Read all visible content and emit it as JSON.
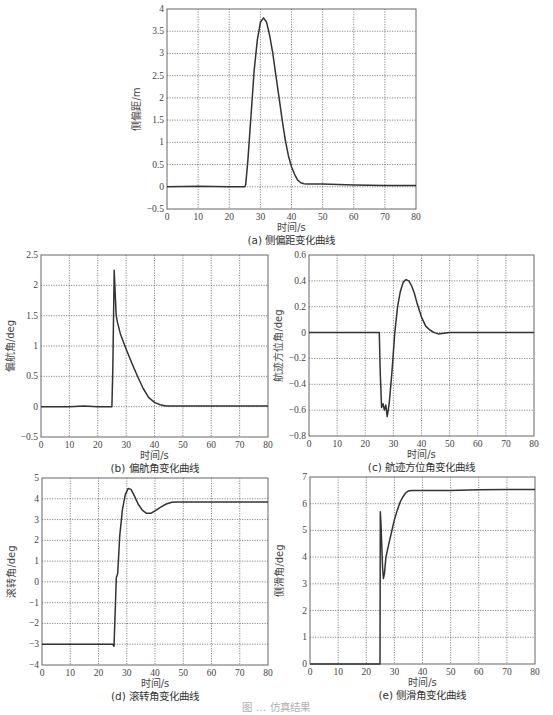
{
  "figure_caption": "图  …  仿真结果",
  "chart_data": [
    {
      "id": "a",
      "type": "line",
      "title": "(a) 侧偏距变化曲线",
      "xlabel": "时间/s",
      "ylabel": "侧偏距/m",
      "xlim": [
        0,
        80
      ],
      "ylim": [
        -0.5,
        4
      ],
      "xticks": [
        0,
        10,
        20,
        30,
        40,
        50,
        60,
        70,
        80
      ],
      "yticks": [
        -0.5,
        0,
        0.5,
        1,
        1.5,
        2,
        2.5,
        3,
        3.5,
        4
      ],
      "grid": true,
      "box": [
        167,
        9,
        416,
        209
      ],
      "x": [
        0,
        10,
        20,
        25,
        25.3,
        26,
        27,
        28,
        29,
        30,
        31,
        32,
        33,
        34,
        35,
        36,
        37,
        38,
        39,
        40,
        41,
        42,
        43,
        44,
        45,
        50,
        60,
        70,
        80
      ],
      "y": [
        0,
        0.01,
        0,
        0,
        0.05,
        0.6,
        1.6,
        2.6,
        3.3,
        3.7,
        3.8,
        3.7,
        3.4,
        3.0,
        2.5,
        2.0,
        1.5,
        1.05,
        0.7,
        0.45,
        0.28,
        0.15,
        0.09,
        0.07,
        0.06,
        0.06,
        0.04,
        0.03,
        0.03
      ]
    },
    {
      "id": "b",
      "type": "line",
      "title": "(b) 偏航角变化曲线",
      "xlabel": "时间/s",
      "ylabel": "偏航角/deg",
      "xlim": [
        0,
        80
      ],
      "ylim": [
        -0.5,
        2.5
      ],
      "xticks": [
        0,
        10,
        20,
        30,
        40,
        50,
        60,
        70,
        80
      ],
      "yticks": [
        -0.5,
        0,
        0.5,
        1,
        1.5,
        2,
        2.5
      ],
      "grid": true,
      "box": [
        41,
        255,
        268,
        437
      ],
      "x": [
        0,
        10,
        15,
        20,
        25,
        25.3,
        25.8,
        26.1,
        26.5,
        27,
        28,
        30,
        32,
        34,
        36,
        38,
        40,
        42,
        44,
        46,
        50,
        60,
        70,
        80
      ],
      "y": [
        0,
        0,
        0.01,
        0,
        0,
        0.6,
        2.25,
        1.9,
        1.5,
        1.38,
        1.2,
        0.95,
        0.72,
        0.5,
        0.3,
        0.15,
        0.07,
        0.03,
        0.01,
        0.01,
        0.01,
        0.01,
        0.01,
        0.01
      ]
    },
    {
      "id": "c",
      "type": "line",
      "title": "(c) 航迹方位角变化曲线",
      "xlabel": "时间/s",
      "ylabel": "航迹方位角/deg",
      "xlim": [
        0,
        80
      ],
      "ylim": [
        -0.8,
        0.6
      ],
      "xticks": [
        0,
        10,
        20,
        30,
        40,
        50,
        60,
        70,
        80
      ],
      "yticks": [
        -0.8,
        -0.6,
        -0.4,
        -0.2,
        0,
        0.2,
        0.4,
        0.6
      ],
      "grid": true,
      "box": [
        309,
        255,
        534,
        436
      ],
      "x": [
        0,
        10,
        20,
        25,
        25.3,
        25.8,
        26.3,
        26.8,
        27.3,
        27.8,
        28.5,
        29.5,
        30.5,
        31.5,
        32.5,
        33.5,
        34.5,
        35.5,
        36.5,
        37.5,
        38.5,
        40,
        41.5,
        43,
        44.5,
        46,
        48,
        50,
        60,
        70,
        80
      ],
      "y": [
        0,
        0,
        0,
        0,
        -0.3,
        -0.58,
        -0.55,
        -0.6,
        -0.56,
        -0.65,
        -0.55,
        -0.3,
        0.0,
        0.2,
        0.32,
        0.39,
        0.41,
        0.4,
        0.36,
        0.3,
        0.22,
        0.12,
        0.05,
        0.02,
        0.0,
        -0.01,
        -0.005,
        0,
        0,
        0,
        0
      ]
    },
    {
      "id": "d",
      "type": "line",
      "title": "(d) 滚转角变化曲线",
      "xlabel": "时间/s",
      "ylabel": "滚转角/deg",
      "xlim": [
        0,
        80
      ],
      "ylim": [
        -4,
        5
      ],
      "xticks": [
        0,
        10,
        20,
        30,
        40,
        50,
        60,
        70,
        80
      ],
      "yticks": [
        -4,
        -3,
        -2,
        -1,
        0,
        1,
        2,
        3,
        4,
        5
      ],
      "grid": true,
      "box": [
        42,
        478,
        268,
        665
      ],
      "x": [
        0,
        10,
        20,
        25,
        25.5,
        26,
        26.3,
        26.8,
        27.5,
        28.5,
        29.5,
        30.5,
        31.5,
        32.5,
        34,
        35.5,
        37,
        38.5,
        40,
        42,
        44,
        46,
        48,
        50,
        60,
        70,
        80
      ],
      "y": [
        -3,
        -3,
        -3,
        -3,
        -3.1,
        -1,
        0.2,
        0.4,
        2.2,
        3.5,
        4.2,
        4.5,
        4.45,
        4.2,
        3.75,
        3.45,
        3.3,
        3.3,
        3.42,
        3.6,
        3.75,
        3.83,
        3.85,
        3.85,
        3.85,
        3.85,
        3.85
      ]
    },
    {
      "id": "e",
      "type": "line",
      "title": "(e) 侧滑角变化曲线",
      "xlabel": "时间/s",
      "ylabel": "侧滑角/deg",
      "xlim": [
        0,
        80
      ],
      "ylim": [
        0,
        7
      ],
      "xticks": [
        0,
        10,
        20,
        30,
        40,
        50,
        60,
        70,
        80
      ],
      "yticks": [
        0,
        1,
        2,
        3,
        4,
        5,
        6,
        7
      ],
      "grid": true,
      "box": [
        310,
        477,
        535,
        664
      ],
      "x": [
        0,
        10,
        20,
        24.9,
        25,
        25.2,
        25.5,
        25.8,
        26.1,
        26.5,
        27,
        28,
        29,
        30,
        31,
        32,
        33,
        34,
        35,
        36,
        37,
        40,
        50,
        60,
        70,
        80
      ],
      "y": [
        0,
        0,
        0,
        0,
        5.7,
        5.3,
        4.5,
        3.6,
        3.2,
        3.4,
        4.0,
        4.5,
        4.95,
        5.4,
        5.75,
        6.05,
        6.25,
        6.4,
        6.48,
        6.5,
        6.5,
        6.5,
        6.5,
        6.52,
        6.53,
        6.53
      ]
    }
  ]
}
